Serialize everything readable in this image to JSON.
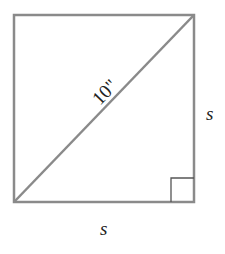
{
  "figure": {
    "shape": "square",
    "diagonal_label": "10\"",
    "right_side_label": "s",
    "bottom_side_label": "s",
    "right_angle_marker": "bottom-right",
    "colors": {
      "stroke": "#8a8a8a",
      "marker": "#555555",
      "text": "#222222",
      "background": "#ffffff"
    }
  }
}
